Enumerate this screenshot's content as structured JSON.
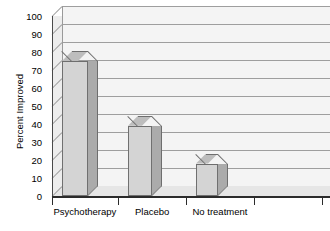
{
  "chart_data": {
    "type": "bar",
    "title": "",
    "subtitle": "",
    "xlabel": "",
    "ylabel": "Percent Improved",
    "categories": [
      "Psychotherapy",
      "Placebo",
      "No treatment"
    ],
    "values": [
      75,
      39,
      18
    ],
    "ylim": [
      0,
      100
    ],
    "ytick_step": 10,
    "yticks": [
      "100",
      "90",
      "80",
      "70",
      "60",
      "50",
      "40",
      "30",
      "20",
      "10",
      "0"
    ],
    "grid": true,
    "legend": "none",
    "style": "3d-column",
    "colors": {
      "bar_front": "#d4d4d4",
      "bar_side": "#ababab",
      "bar_top": "#bdbdbd",
      "bar_edge": "#707070",
      "wall_back": "#f4f4f4",
      "wall_side": "#ededed",
      "floor": "#e6e6e6",
      "gridline": "#9e9e9e",
      "axis": "#2b2b2b",
      "text": "#000000"
    }
  },
  "axis": {
    "y_title": "Percent Improved"
  }
}
